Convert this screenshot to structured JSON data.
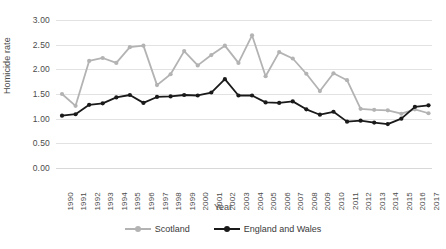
{
  "chart_data": {
    "type": "line",
    "title": "",
    "xlabel": "Year",
    "ylabel": "Homicide rate",
    "ylim": [
      0.0,
      3.0
    ],
    "ytick_labels": [
      "0.00",
      "0.50",
      "1.00",
      "1.50",
      "2.00",
      "2.50",
      "3.00"
    ],
    "ytick_values": [
      0.0,
      0.5,
      1.0,
      1.5,
      2.0,
      2.5,
      3.0
    ],
    "grid": true,
    "legend_position": "bottom-center",
    "categories": [
      "1990",
      "1991",
      "1992",
      "1993",
      "1994",
      "1995",
      "1996",
      "1997",
      "1998",
      "1999",
      "2000",
      "2001",
      "2002",
      "2003",
      "2004",
      "2005",
      "2006",
      "2007",
      "2008",
      "2009",
      "2010",
      "2011",
      "2012",
      "2013",
      "2014",
      "2015",
      "2016",
      "2017"
    ],
    "x": [
      1990,
      1991,
      1992,
      1993,
      1994,
      1995,
      1996,
      1997,
      1998,
      1999,
      2000,
      2001,
      2002,
      2003,
      2004,
      2005,
      2006,
      2007,
      2008,
      2009,
      2010,
      2011,
      2012,
      2013,
      2014,
      2015,
      2016,
      2017
    ],
    "series": [
      {
        "name": "Scotland",
        "color": "#b3b3b3",
        "marker": "circle",
        "values": [
          1.5,
          1.26,
          2.17,
          2.23,
          2.13,
          2.45,
          2.48,
          1.68,
          1.9,
          2.37,
          2.08,
          2.29,
          2.48,
          2.13,
          2.69,
          1.86,
          2.35,
          2.22,
          1.91,
          1.56,
          1.92,
          1.78,
          1.2,
          1.18,
          1.17,
          1.1,
          1.19,
          1.11
        ]
      },
      {
        "name": "England and Wales",
        "color": "#1a1a1a",
        "marker": "circle",
        "values": [
          1.06,
          1.09,
          1.28,
          1.31,
          1.43,
          1.48,
          1.32,
          1.44,
          1.45,
          1.48,
          1.47,
          1.53,
          1.8,
          1.47,
          1.47,
          1.33,
          1.32,
          1.35,
          1.19,
          1.08,
          1.14,
          0.94,
          0.96,
          0.92,
          0.89,
          1.0,
          1.24,
          1.27
        ]
      }
    ]
  },
  "legend": {
    "items": [
      {
        "label": "Scotland",
        "color": "#b3b3b3"
      },
      {
        "label": "England and Wales",
        "color": "#1a1a1a"
      }
    ]
  },
  "axes": {
    "x_title": "Year",
    "y_title": "Homicide rate"
  }
}
